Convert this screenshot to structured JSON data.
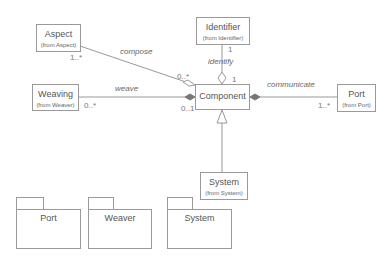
{
  "diagram": {
    "type": "UML class diagram",
    "classes": [
      {
        "id": "aspect",
        "name": "Aspect",
        "from": "(from Aspect)"
      },
      {
        "id": "identifier",
        "name": "Identifier",
        "from": "(from Identifier)"
      },
      {
        "id": "weaving",
        "name": "Weaving",
        "from": "(from Weaver)"
      },
      {
        "id": "component",
        "name": "Component"
      },
      {
        "id": "port",
        "name": "Port",
        "from": "(from Port)"
      },
      {
        "id": "system",
        "name": "System",
        "from": "(from System)"
      }
    ],
    "associations": [
      {
        "label": "compose",
        "from": "Aspect",
        "to": "Component",
        "kind": "aggregation",
        "source_mult": "1..*",
        "target_mult": "0..*"
      },
      {
        "label": "weave",
        "from": "Weaving",
        "to": "Component",
        "kind": "composition",
        "source_mult": "0..*",
        "target_mult": "0..1"
      },
      {
        "label": "identify",
        "from": "Identifier",
        "to": "Component",
        "kind": "aggregation",
        "source_mult": "1",
        "target_mult": "1"
      },
      {
        "label": "communicate",
        "from": "Port",
        "to": "Component",
        "kind": "composition",
        "source_mult": "1..*"
      },
      {
        "label": "",
        "from": "System",
        "to": "Component",
        "kind": "generalization"
      }
    ],
    "packages": [
      {
        "name": "Port"
      },
      {
        "name": "Weaver"
      },
      {
        "name": "System"
      }
    ]
  }
}
